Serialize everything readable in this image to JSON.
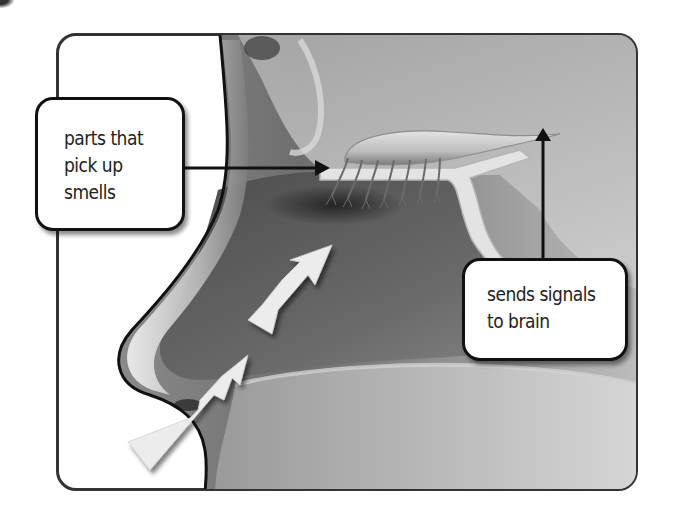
{
  "diagram": {
    "labels": {
      "smell_receptors": {
        "lines": [
          "parts that",
          "pick up",
          "smells"
        ]
      },
      "brain_signal": {
        "lines": [
          "sends signals",
          "to brain"
        ]
      }
    },
    "airflow_arrows": {
      "count": 3,
      "direction": "up and into the nasal cavity"
    },
    "colors": {
      "frame_border": "#333333",
      "label_border": "#111111",
      "label_fill": "#ffffff",
      "pointer": "#111111",
      "airflow_arrow": "#eeeeee",
      "tissue_dark": "#5a5a5a",
      "tissue_light": "#c8c8c8"
    }
  }
}
